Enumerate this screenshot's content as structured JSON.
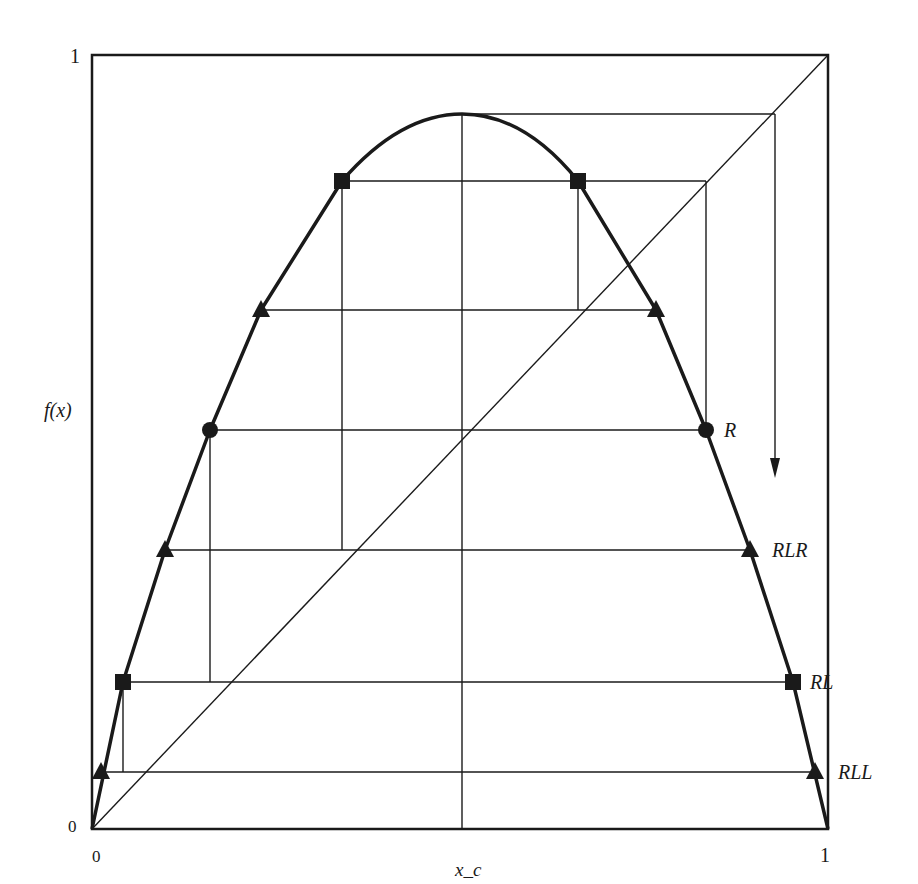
{
  "figure": {
    "type": "diagram",
    "axes": {
      "y_label": "f(x)",
      "x_label": "x_c",
      "y_top_tick": "1",
      "y_bottom_tick": "0",
      "x_left_tick": "0",
      "x_right_tick": "1"
    },
    "point_labels": {
      "R": "R",
      "RLR": "RLR",
      "RL": "RL",
      "RLL": "RLL"
    },
    "markers": {
      "square": "square-marker",
      "triangle": "triangle-marker",
      "circle": "circle-marker"
    },
    "colors": {
      "ink": "#1a1a1a",
      "background": "#ffffff"
    }
  }
}
